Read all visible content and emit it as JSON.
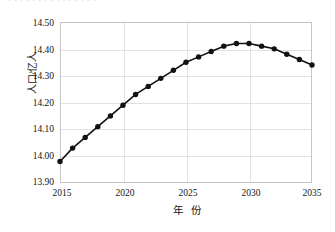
{
  "figure": {
    "top_clipped_caption": "· · · · · · ·  · · ·  · · · · ·",
    "background_color": "#ffffff",
    "series_color": "#111111",
    "grid_color": "#e2e2e2",
    "frame_color": "#c6c6c6"
  },
  "chart_data": {
    "type": "line",
    "title": "",
    "subtitle": "",
    "xlabel": "年 份",
    "ylabel": "人口/亿人",
    "xlim": [
      2015,
      2035
    ],
    "ylim": [
      13.9,
      14.5
    ],
    "ytick_labels": [
      "14.50",
      "14.40",
      "14.30",
      "14.20",
      "14.10",
      "14.00",
      "13.90"
    ],
    "ytick_values": [
      14.5,
      14.4,
      14.3,
      14.2,
      14.1,
      14.0,
      13.9
    ],
    "xtick_labels": [
      "2015",
      "2020",
      "2025",
      "2030",
      "2035"
    ],
    "xtick_values": [
      2015,
      2020,
      2025,
      2030,
      2035
    ],
    "grid": true,
    "legend": null,
    "legend_position": "none",
    "marker": "filled-circle",
    "x": [
      2015,
      2016,
      2017,
      2018,
      2019,
      2020,
      2021,
      2022,
      2023,
      2024,
      2025,
      2026,
      2027,
      2028,
      2029,
      2030,
      2031,
      2032,
      2033,
      2034,
      2035
    ],
    "values": [
      13.98,
      14.03,
      14.07,
      14.11,
      14.15,
      14.19,
      14.23,
      14.26,
      14.29,
      14.32,
      14.35,
      14.37,
      14.39,
      14.41,
      14.42,
      14.42,
      14.41,
      14.4,
      14.38,
      14.36,
      14.34
    ],
    "series": [
      {
        "name": "人口",
        "values": [
          13.98,
          14.03,
          14.07,
          14.11,
          14.15,
          14.19,
          14.23,
          14.26,
          14.29,
          14.32,
          14.35,
          14.37,
          14.39,
          14.41,
          14.42,
          14.42,
          14.41,
          14.4,
          14.38,
          14.36,
          14.34
        ]
      }
    ],
    "annotations": []
  }
}
